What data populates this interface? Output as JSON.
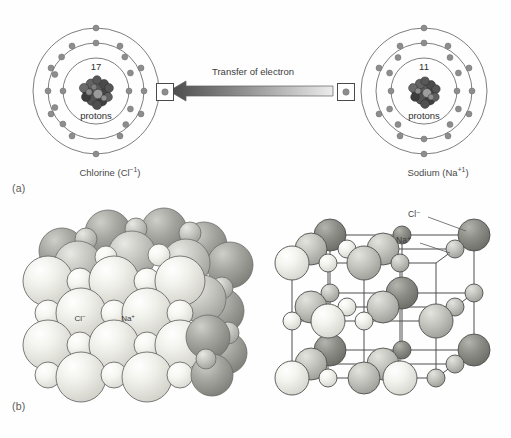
{
  "figure": {
    "panels": [
      {
        "letter": "(a)",
        "desc": "Electron transfer between chlorine and sodium atoms"
      },
      {
        "letter": "(b)",
        "desc": "NaCl crystal lattice: close-packed model and ball-and-stick model"
      }
    ]
  },
  "panel_a": {
    "letter": "(a)",
    "transfer_label": "Transfer of electron",
    "chlorine": {
      "caption_name": "Chlorine",
      "caption_ion": "Cl",
      "caption_charge": "−1",
      "caption_full": "Chlorine (Cl⁻¹)",
      "nucleus_count": "17",
      "nucleus_unit": "protons",
      "shell_electrons": [
        2,
        8,
        8
      ],
      "shell_count": 3
    },
    "sodium": {
      "caption_name": "Sodium",
      "caption_ion": "Na",
      "caption_charge": "+1",
      "caption_full": "Sodium (Na⁺¹)",
      "nucleus_count": "11",
      "nucleus_unit": "protons",
      "shell_electrons": [
        2,
        8,
        1
      ],
      "shell_count": 3
    }
  },
  "panel_b": {
    "letter": "(b)",
    "packed_model": {
      "label_chloride": "Cl⁻",
      "label_sodium": "Na⁺"
    },
    "lattice_model": {
      "label_chloride": "Cl⁻",
      "label_sodium": "Na⁺"
    }
  },
  "colors": {
    "background": "#fefefe",
    "line": "#6b6b6b",
    "electron": "#8f8f8f",
    "nucleus_dark": "#4a4a4a",
    "chloride_sphere": "#e9e9e4",
    "sodium_sphere": "#f2f2ee",
    "chloride_dark_sphere": "#8e8e8e",
    "text": "#3a3a3a",
    "arrow_dark": "#4f4f4f",
    "arrow_light": "#e2e2e2"
  }
}
